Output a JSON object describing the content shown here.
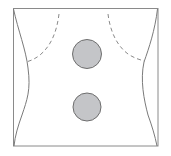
{
  "diagram": {
    "type": "torso-electrode-placement",
    "frame": {
      "x": 13,
      "y": 8,
      "width": 145,
      "height": 138,
      "stroke": "#8a8a8a"
    },
    "outline_color": "#7a7a7a",
    "dashed_color": "#8a8a8a",
    "pads": [
      {
        "name": "upper-pad",
        "cx": 87,
        "cy": 54,
        "r": 15,
        "fill": "#c4c5c8",
        "stroke": "#6e6e6e"
      },
      {
        "name": "lower-pad",
        "cx": 87,
        "cy": 107,
        "r": 14.5,
        "fill": "#c4c5c8",
        "stroke": "#6e6e6e"
      }
    ]
  }
}
